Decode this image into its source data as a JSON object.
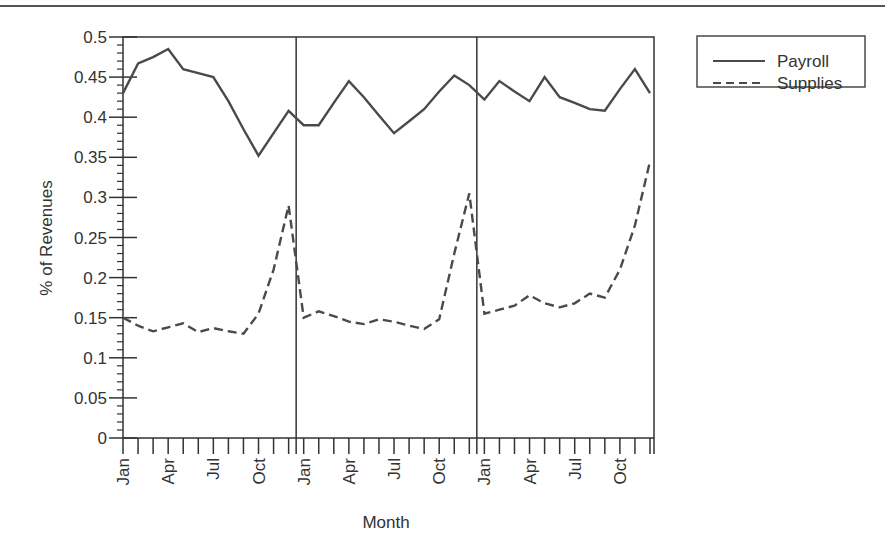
{
  "chart_data": {
    "type": "line",
    "title": "",
    "xlabel": "Month",
    "ylabel": "% of Revenues",
    "ylim": [
      0,
      0.5
    ],
    "yticks": [
      "0",
      "0.05",
      "0.1",
      "0.15",
      "0.2",
      "0.25",
      "0.3",
      "0.35",
      "0.4",
      "0.45",
      "0.5"
    ],
    "xtick_labels": [
      "Jan",
      "Apr",
      "Jul",
      "Oct",
      "Jan",
      "Apr",
      "Jul",
      "Oct",
      "Jan",
      "Apr",
      "Jul",
      "Oct"
    ],
    "grid": false,
    "legend_position": "upper right, outside plot",
    "year_separators_after_month": [
      12,
      24
    ],
    "x": [
      "Jan",
      "Feb",
      "Mar",
      "Apr",
      "May",
      "Jun",
      "Jul",
      "Aug",
      "Sep",
      "Oct",
      "Nov",
      "Dec",
      "Jan",
      "Feb",
      "Mar",
      "Apr",
      "May",
      "Jun",
      "Jul",
      "Aug",
      "Sep",
      "Oct",
      "Nov",
      "Dec",
      "Jan",
      "Feb",
      "Mar",
      "Apr",
      "May",
      "Jun",
      "Jul",
      "Aug",
      "Sep",
      "Oct",
      "Nov",
      "Dec"
    ],
    "series": [
      {
        "name": "Payroll",
        "style": "solid",
        "values": [
          0.43,
          0.467,
          0.475,
          0.485,
          0.46,
          0.455,
          0.45,
          0.42,
          0.385,
          0.352,
          0.38,
          0.408,
          0.39,
          0.39,
          0.418,
          0.445,
          0.425,
          0.402,
          0.38,
          0.395,
          0.41,
          0.432,
          0.452,
          0.44,
          0.422,
          0.445,
          0.432,
          0.42,
          0.45,
          0.425,
          0.418,
          0.41,
          0.408,
          0.435,
          0.46,
          0.43
        ]
      },
      {
        "name": "Supplies",
        "style": "dashed",
        "values": [
          0.15,
          0.14,
          0.133,
          0.138,
          0.143,
          0.132,
          0.137,
          0.133,
          0.13,
          0.155,
          0.21,
          0.29,
          0.15,
          0.158,
          0.152,
          0.145,
          0.142,
          0.148,
          0.145,
          0.14,
          0.136,
          0.148,
          0.23,
          0.305,
          0.155,
          0.16,
          0.165,
          0.178,
          0.168,
          0.163,
          0.168,
          0.18,
          0.175,
          0.21,
          0.265,
          0.345
        ]
      }
    ]
  },
  "legend": {
    "items": [
      {
        "label": "Payroll",
        "style": "solid"
      },
      {
        "label": "Supplies",
        "style": "dashed"
      }
    ]
  },
  "colors": {
    "line": "#4a4a4a",
    "axis": "#333333",
    "text": "#333333"
  }
}
